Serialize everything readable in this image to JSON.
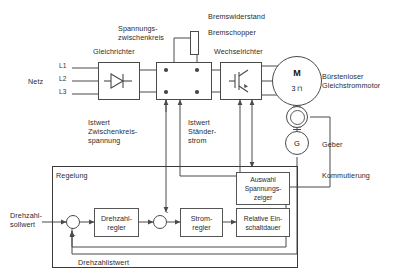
{
  "diagram": {
    "title_labels": {
      "netz": "Netz",
      "gleichrichter": "Gleichrichter",
      "spannungszwischenkreis": "Spannungs-\nzwischenkreis",
      "bremswiderstand": "Bremswiderstand",
      "bremschopper": "Bremschopper",
      "wechselrichter": "Wechselrichter",
      "motor_name": "Bürstenloser\nGleichstrommotor",
      "geber": "Geber",
      "kommutierung": "Kommutierung"
    },
    "phases": [
      "L1",
      "L2",
      "L3"
    ],
    "motor": {
      "symbol": "M",
      "sub": "3 ⊓"
    },
    "encoder": {
      "symbol": "G"
    },
    "feedback_labels": {
      "zwischenkreisspannung": "Istwert\nZwischenkreis-\nspannung",
      "staenderstrom": "Istwert\nStänder-\nstrom"
    },
    "control": {
      "section_label": "Regelung",
      "setpoint_label": "Drehzahl-\nsollwert",
      "feedback_label": "Drehzahlistwert",
      "blocks": [
        {
          "id": "drehzahlregler",
          "label": "Drehzahl-\nregler"
        },
        {
          "id": "stromregler",
          "label": "Strom-\nregler"
        },
        {
          "id": "relative_einschaltdauer",
          "label": "Relative Ein-\nschaltdauer"
        },
        {
          "id": "auswahl_spannungszeiger",
          "label": "Auswahl\nSpannungs-\nzeiger"
        }
      ],
      "sum_signs": [
        "-",
        "-"
      ]
    },
    "colors": {
      "line": "#4a4a4a",
      "text": "#2b2b2b",
      "frame": "#3a3a3a",
      "background": "#ffffff"
    }
  }
}
